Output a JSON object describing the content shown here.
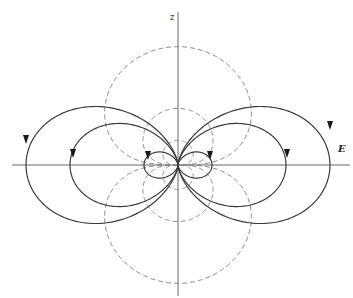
{
  "diagram": {
    "origin": [
      178,
      165
    ],
    "labels": {
      "z_axis": "z",
      "field": "E"
    },
    "colors": {
      "field_lines": "#3a3a3a",
      "equipotentials": "#8a8a8a",
      "axes": "#555555"
    },
    "field_line_k": [
      152,
      108,
      34
    ],
    "equipotential_c": [
      14000,
      3200,
      600
    ],
    "arrows": [
      {
        "x": 26,
        "y": 140,
        "dir": "down"
      },
      {
        "x": 330,
        "y": 126,
        "dir": "down"
      },
      {
        "x": 73,
        "y": 154,
        "dir": "down"
      },
      {
        "x": 287,
        "y": 154,
        "dir": "down"
      },
      {
        "x": 148,
        "y": 156,
        "dir": "down"
      },
      {
        "x": 210,
        "y": 156,
        "dir": "down"
      }
    ]
  }
}
